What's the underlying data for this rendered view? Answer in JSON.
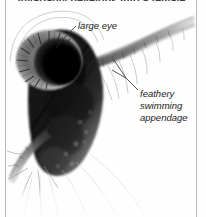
{
  "figure": {
    "caption_fragment": "invariably develops into a female.",
    "background_color": "#fefefe",
    "border_color": "#b9b9b9"
  },
  "labels": {
    "large_eye": "large eye",
    "appendage_line1": "feathery",
    "appendage_line2": "swimming",
    "appendage_line3": "appendage"
  },
  "icons": {
    "leader_line": "leader-line"
  }
}
